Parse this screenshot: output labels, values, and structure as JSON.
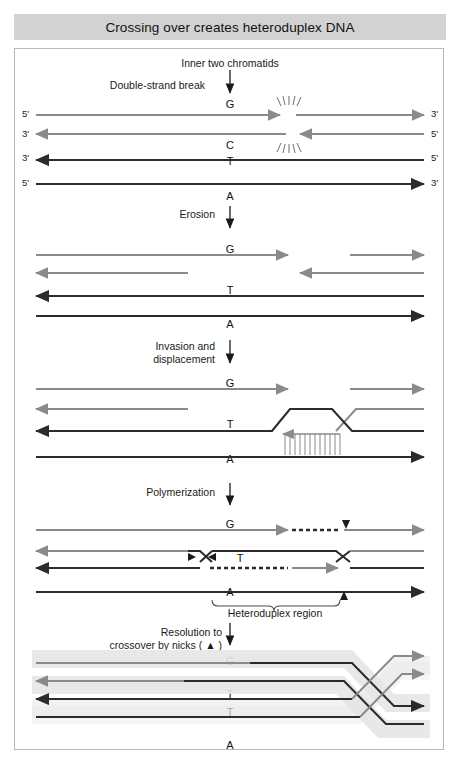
{
  "title": "Crossing over creates heteroduplex DNA",
  "colors": {
    "title_bar": "#d2d2d2",
    "frame_border": "#b9b9b9",
    "gray_strand": "#8a8a8a",
    "black_strand": "#2b2b2b",
    "highlight_band": "#e3e3e3",
    "background": "#ffffff",
    "text": "#1a1a1a"
  },
  "stages": [
    {
      "id": "stage-break",
      "annotations": [
        "Inner two chromatids",
        "Double-strand break"
      ],
      "bases": [
        "G",
        "C",
        "T",
        "A"
      ],
      "end_labels_left": [
        "5'",
        "3'",
        "3'",
        "5'"
      ],
      "end_labels_right": [
        "3'",
        "5'",
        "5'",
        "3'"
      ],
      "event": "Double-strand break in inner two chromatids"
    },
    {
      "id": "stage-erosion",
      "step_label": "Erosion",
      "bases": [
        "G",
        "T",
        "A"
      ],
      "event": "5' ends eroded back from the break"
    },
    {
      "id": "stage-invasion",
      "step_label": "Invasion and\ndisplacement",
      "step_label_line1": "Invasion and",
      "step_label_line2": "displacement",
      "bases": [
        "G",
        "T",
        "A"
      ],
      "event": "Strand invasion forms D-loop with base pairing"
    },
    {
      "id": "stage-polymerization",
      "step_label": "Polymerization",
      "bases": [
        "G",
        "T",
        "A"
      ],
      "brace_label": "Heteroduplex region",
      "event": "New DNA synthesized; two Holliday junctions formed"
    },
    {
      "id": "stage-resolution",
      "step_label_line1": "Resolution to",
      "step_label_line2": "crossover by nicks ( ▲ )",
      "bases": [
        "G",
        "T",
        "T",
        "A"
      ],
      "event": "Junctions resolved by nicks producing crossover"
    }
  ],
  "legend": {
    "nick_marker": "▲",
    "nick_meaning": "nick"
  }
}
